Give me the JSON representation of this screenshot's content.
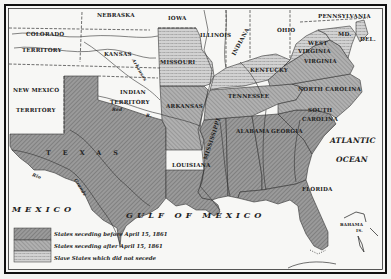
{
  "map": {
    "title": "Secession of the Southern States, 1861",
    "states_and_territories": [
      {
        "label": "NEBRASKA",
        "status": "free"
      },
      {
        "label": "IOWA",
        "status": "free"
      },
      {
        "label": "ILLINOIS",
        "status": "free"
      },
      {
        "label": "INDIANA",
        "status": "free"
      },
      {
        "label": "OHIO",
        "status": "free"
      },
      {
        "label": "PENNSYLVANIA",
        "status": "free"
      },
      {
        "label": "COLORADO",
        "label2": "TERRITORY",
        "status": "free"
      },
      {
        "label": "KANSAS",
        "status": "free"
      },
      {
        "label": "MISSOURI",
        "status": "slave-not-seceding"
      },
      {
        "label": "KENTUCKY",
        "status": "slave-not-seceding"
      },
      {
        "label": "WEST",
        "label2": "VIRGINIA",
        "status": "slave-not-seceding"
      },
      {
        "label": "MD.",
        "status": "slave-not-seceding"
      },
      {
        "label": "DEL.",
        "status": "slave-not-seceding"
      },
      {
        "label": "NEW MEXICO",
        "label2": "TERRITORY",
        "status": "free"
      },
      {
        "label": "INDIAN",
        "label2": "TERRITORY",
        "status": "free"
      },
      {
        "label": "VIRGINIA",
        "status": "after"
      },
      {
        "label": "NORTH CAROLINA",
        "status": "after"
      },
      {
        "label": "TENNESSEE",
        "status": "after"
      },
      {
        "label": "ARKANSAS",
        "status": "after"
      },
      {
        "label": "SOUTH",
        "label2": "CAROLINA",
        "status": "before"
      },
      {
        "label": "MISSISSIPPI",
        "status": "before"
      },
      {
        "label": "ALABAMA",
        "status": "before"
      },
      {
        "label": "GEORGIA",
        "status": "before"
      },
      {
        "label": "LOUISIANA",
        "status": "before"
      },
      {
        "label": "FLORIDA",
        "status": "before"
      },
      {
        "label": "TEXAS",
        "status": "before"
      }
    ],
    "water_labels": {
      "gulf": "GULF OF MEXICO",
      "atlantic": "ATLANTIC",
      "ocean": "OCEAN",
      "mexico": "MEXICO",
      "bahama": "BAHAMA",
      "bahama_is": "IS."
    },
    "river_labels": {
      "rio_grande_1": "Rio",
      "rio_grande_2": "Grande",
      "red": "Red",
      "red_r": "R.",
      "arkansas": "Arkansas"
    },
    "legend": [
      {
        "label": "States seceding before April 15, 1861",
        "pattern": "before"
      },
      {
        "label": "States seceding after April 15, 1861",
        "pattern": "after"
      },
      {
        "label": "Slave States which did not secede",
        "pattern": "slave"
      }
    ],
    "colors": {
      "paper": "#f4f4f2",
      "land_free": "#f7f7f5",
      "before": "#8e8e8e",
      "after": "#a3a3a3",
      "slave": "#c4c4c4",
      "ink": "#222222"
    }
  }
}
